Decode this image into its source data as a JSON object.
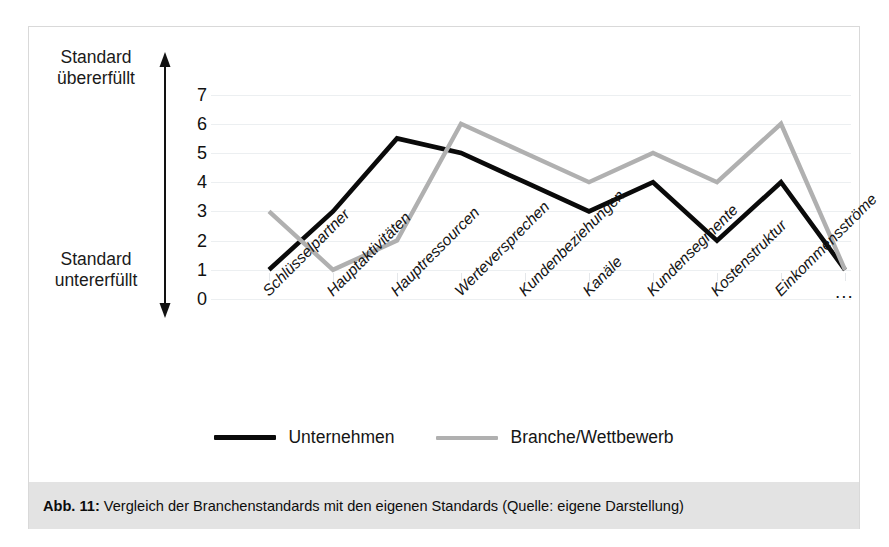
{
  "figure": {
    "caption_prefix": "Abb. 11:",
    "caption_body": " Vergleich der Branchenstandards mit den eigenen Standards (Quelle: eigene Darstellung)"
  },
  "axis_meaning": {
    "top": "Standard\nübererfüllt",
    "bottom": "Standard\nuntererfüllt"
  },
  "legend": {
    "items": [
      {
        "label": "Unternehmen",
        "color": "#0a0a0a"
      },
      {
        "label": "Branche/Wettbewerb",
        "color": "#b0b0b0"
      }
    ]
  },
  "chart_data": {
    "type": "line",
    "title": "",
    "xlabel": "",
    "ylabel": "",
    "ylim": [
      0,
      7
    ],
    "yticks": [
      7,
      6,
      5,
      4,
      3,
      2,
      1,
      0
    ],
    "grid": true,
    "legend_position": "bottom",
    "categories": [
      "Schlüsselpartner",
      "Hauptaktivitäten",
      "Hauptressourcen",
      "Werteversprechen",
      "Kundenbeziehungen",
      "Kanäle",
      "Kundensegmente",
      "Kostenstruktur",
      "Einkommensströme",
      "..."
    ],
    "series": [
      {
        "name": "Unternehmen",
        "color": "#0a0a0a",
        "values": [
          1,
          3,
          5.5,
          5,
          4,
          3,
          4,
          2,
          4,
          1
        ]
      },
      {
        "name": "Branche/Wettbewerb",
        "color": "#b0b0b0",
        "values": [
          3,
          1,
          2,
          6,
          5,
          4,
          5,
          4,
          6,
          1
        ]
      }
    ],
    "annotations": [
      "Standard übererfüllt",
      "Standard untererfüllt"
    ]
  }
}
